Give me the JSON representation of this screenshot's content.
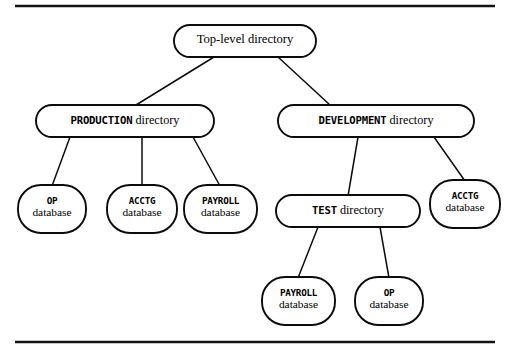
{
  "figure": {
    "type": "tree-diagram",
    "background_color": "#ffffff",
    "line_color": "#0b0b0b",
    "rule_color": "#121212"
  },
  "rules": {
    "top": {
      "name": "top-horizontal-rule",
      "x1": 15,
      "y": 6,
      "x2": 495
    },
    "bottom": {
      "name": "bottom-horizontal-rule",
      "x1": 15,
      "y": 342,
      "x2": 495
    }
  },
  "nodes": {
    "top_level": {
      "id": "top-level-directory",
      "shape": "rounded-rect",
      "label_full": "Top-level directory",
      "label_prefix": "",
      "label_suffix": "Top-level directory",
      "x": 174,
      "y": 25,
      "w": 142,
      "h": 32
    },
    "production": {
      "id": "production-directory",
      "shape": "rounded-rect",
      "label_full": "PRODUCTION directory",
      "label_prefix": "PRODUCTION",
      "label_suffix": " directory",
      "x": 36,
      "y": 105,
      "w": 178,
      "h": 32
    },
    "development": {
      "id": "development-directory",
      "shape": "rounded-rect",
      "label_full": "DEVELOPMENT directory",
      "label_prefix": "DEVELOPMENT",
      "label_suffix": " directory",
      "x": 278,
      "y": 105,
      "w": 196,
      "h": 32
    },
    "test": {
      "id": "test-directory",
      "shape": "rounded-rect",
      "label_full": "TEST directory",
      "label_prefix": "TEST",
      "label_suffix": " directory",
      "x": 276,
      "y": 195,
      "w": 144,
      "h": 32
    },
    "prod_op_db": {
      "id": "production-op-database",
      "shape": "rounded-rect-wide-radius",
      "label_line1": "OP",
      "label_line2": "database",
      "x": 18,
      "y": 185,
      "w": 68,
      "h": 48
    },
    "prod_acctg_db": {
      "id": "production-acctg-database",
      "shape": "rounded-rect-wide-radius",
      "label_line1": "ACCTG",
      "label_line2": "database",
      "x": 107,
      "y": 185,
      "w": 70,
      "h": 48
    },
    "prod_payroll_db": {
      "id": "production-payroll-database",
      "shape": "rounded-rect-wide-radius",
      "label_line1": "PAYROLL",
      "label_line2": "database",
      "x": 184,
      "y": 185,
      "w": 73,
      "h": 48
    },
    "dev_acctg_db": {
      "id": "development-acctg-database",
      "shape": "rounded-rect-wide-radius",
      "label_line1": "ACCTG",
      "label_line2": "database",
      "x": 430,
      "y": 180,
      "w": 70,
      "h": 48
    },
    "test_payroll_db": {
      "id": "test-payroll-database",
      "shape": "rounded-rect-wide-radius",
      "label_line1": "PAYROLL",
      "label_line2": "database",
      "x": 262,
      "y": 277,
      "w": 73,
      "h": 48
    },
    "test_op_db": {
      "id": "test-op-database",
      "shape": "rounded-rect-wide-radius",
      "label_line1": "OP",
      "label_line2": "database",
      "x": 355,
      "y": 277,
      "w": 68,
      "h": 48
    }
  },
  "edges": [
    {
      "name": "edge-top-to-production",
      "from": "top_level",
      "to": "production",
      "x1": 214,
      "y1": 57,
      "x2": 136,
      "y2": 105
    },
    {
      "name": "edge-top-to-development",
      "from": "top_level",
      "to": "development",
      "x1": 278,
      "y1": 57,
      "x2": 330,
      "y2": 105
    },
    {
      "name": "edge-production-to-op",
      "from": "production",
      "to": "prod_op_db",
      "x1": 70,
      "y1": 137,
      "x2": 52,
      "y2": 185
    },
    {
      "name": "edge-production-to-acctg",
      "from": "production",
      "to": "prod_acctg_db",
      "x1": 142,
      "y1": 137,
      "x2": 142,
      "y2": 185
    },
    {
      "name": "edge-production-to-payroll",
      "from": "production",
      "to": "prod_payroll_db",
      "x1": 193,
      "y1": 137,
      "x2": 220,
      "y2": 185
    },
    {
      "name": "edge-development-to-test",
      "from": "development",
      "to": "test",
      "x1": 358,
      "y1": 137,
      "x2": 348,
      "y2": 195
    },
    {
      "name": "edge-development-to-acctg",
      "from": "development",
      "to": "dev_acctg_db",
      "x1": 434,
      "y1": 137,
      "x2": 465,
      "y2": 180
    },
    {
      "name": "edge-test-to-payroll",
      "from": "test",
      "to": "test_payroll_db",
      "x1": 318,
      "y1": 227,
      "x2": 298,
      "y2": 277
    },
    {
      "name": "edge-test-to-op",
      "from": "test",
      "to": "test_op_db",
      "x1": 380,
      "y1": 227,
      "x2": 389,
      "y2": 277
    }
  ],
  "hierarchy": {
    "root": "Top-level directory",
    "children": [
      {
        "name": "PRODUCTION directory",
        "children": [
          "OP database",
          "ACCTG database",
          "PAYROLL database"
        ]
      },
      {
        "name": "DEVELOPMENT directory",
        "children": [
          {
            "name": "TEST directory",
            "children": [
              "PAYROLL database",
              "OP database"
            ]
          },
          "ACCTG database"
        ]
      }
    ]
  }
}
